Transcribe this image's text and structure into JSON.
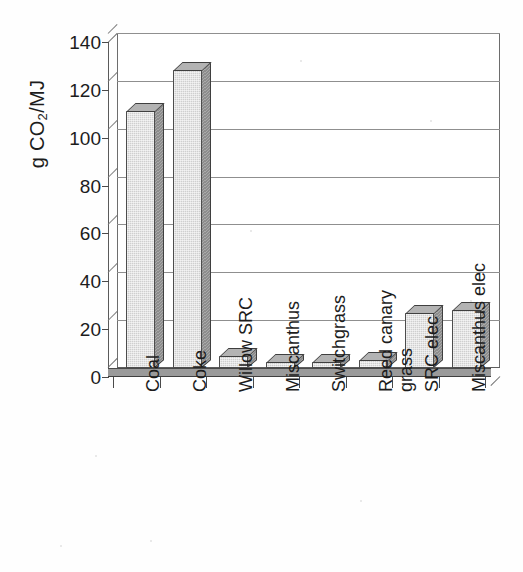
{
  "chart_data": {
    "type": "bar",
    "title": "",
    "xlabel": "",
    "ylabel": "g CO2/MJ",
    "ylabel_html": "g CO<sub>2</sub>/MJ",
    "ylim": [
      0,
      140
    ],
    "yticks": [
      0,
      20,
      40,
      60,
      80,
      100,
      120,
      140
    ],
    "ytick_labels": [
      "0",
      "20",
      "40",
      "60",
      "80",
      "100",
      "120",
      "140"
    ],
    "grid": true,
    "legend": "none",
    "style": "3d-column",
    "categories": [
      "Coal",
      "Coke",
      "Willow SRC",
      "Miscanthus",
      "Switchgrass",
      "Reed canary grass",
      "SRC elec",
      "Miscanthus elec"
    ],
    "category_label_lines": [
      [
        "Coal"
      ],
      [
        "Coke"
      ],
      [
        "Willow SRC"
      ],
      [
        "Miscanthus"
      ],
      [
        "Switchgrass"
      ],
      [
        "Reed canary",
        "grass"
      ],
      [
        "SRC elec"
      ],
      [
        "Miscanthus elec"
      ]
    ],
    "values": [
      107,
      124,
      4.5,
      2,
      2,
      3,
      22.5,
      24
    ],
    "series": [
      {
        "name": "g CO2/MJ",
        "values": [
          107,
          124,
          4.5,
          2,
          2,
          3,
          22.5,
          24
        ]
      }
    ]
  },
  "colors": {
    "bar_face": "#cfcfcf",
    "bar_side": "#8d8d8d",
    "bar_top": "#b3b3b3",
    "bar_outline": "#3f3f3f",
    "gridline": "#8f8f8f",
    "axis": "#4a4a4a",
    "plot_background": "#ffffff",
    "page_background": "#fefefe",
    "text": "#1c1c1c"
  }
}
